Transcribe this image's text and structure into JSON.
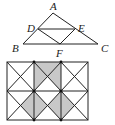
{
  "triangle_figure": {
    "points": {
      "A": {
        "label": "A",
        "x": 53,
        "y": 13
      },
      "B": {
        "label": "B",
        "x": 23,
        "y": 44
      },
      "C": {
        "label": "C",
        "x": 98,
        "y": 44
      },
      "D": {
        "label": "D",
        "x": 38,
        "y": 29
      },
      "E": {
        "label": "E",
        "x": 75,
        "y": 29
      },
      "F": {
        "label": "F",
        "x": 60,
        "y": 44
      }
    },
    "segments": [
      "AB",
      "AC",
      "BC",
      "DE",
      "DF",
      "EF"
    ]
  },
  "grid_figure": {
    "rows": 2,
    "cols": 3,
    "shade_color": "#c8c8c8",
    "shaded_triangles": [
      {
        "row": 0,
        "col": 1,
        "parts": [
          "top",
          "left",
          "right"
        ]
      },
      {
        "row": 1,
        "col": 0,
        "parts": [
          "right"
        ]
      },
      {
        "row": 1,
        "col": 1,
        "parts": [
          "left",
          "right"
        ]
      },
      {
        "row": 1,
        "col": 2,
        "parts": [
          "left"
        ]
      }
    ]
  }
}
